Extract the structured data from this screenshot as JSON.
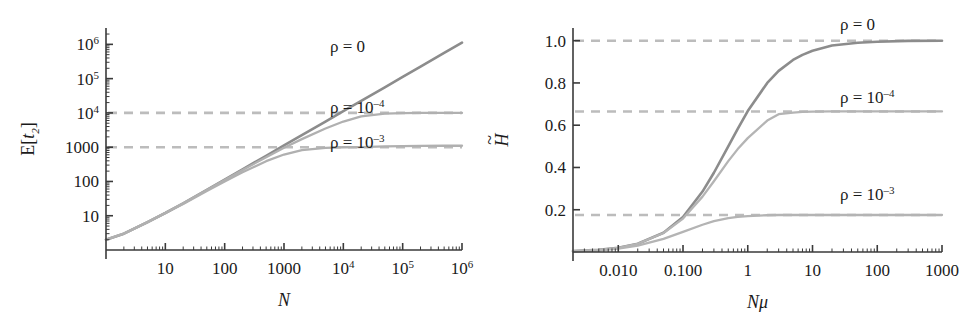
{
  "figure": {
    "background": "#ffffff",
    "panels": [
      "left",
      "right"
    ]
  },
  "colors": {
    "curve_dark": "#8c8c8c",
    "curve_mid": "#a8a8a8",
    "curve_light": "#bdbdbd",
    "dashed": "#bcbcbc",
    "axis": "#3a3a3a",
    "text": "#1a1a1a"
  },
  "chart_data": [
    {
      "id": "left",
      "type": "line",
      "title": "",
      "xlabel": "N",
      "ylabel": "E[t₂]",
      "ylabel_parts": {
        "base": "E[",
        "italic": "t",
        "sub": "2",
        "close": "]"
      },
      "xscale": "log",
      "yscale": "log",
      "xlim": [
        1,
        1000000
      ],
      "ylim": [
        1,
        3000000
      ],
      "xticks": [
        10,
        100,
        1000,
        10000,
        100000,
        1000000
      ],
      "xticklabels": [
        "10",
        "100",
        "1000",
        "10⁴",
        "10⁵",
        "10⁶"
      ],
      "xticklabel_parts": [
        {
          "base": "10",
          "sup": ""
        },
        {
          "base": "100",
          "sup": ""
        },
        {
          "base": "1000",
          "sup": ""
        },
        {
          "base": "10",
          "sup": "4"
        },
        {
          "base": "10",
          "sup": "5"
        },
        {
          "base": "10",
          "sup": "6"
        }
      ],
      "yticks": [
        10,
        100,
        1000,
        10000,
        100000,
        1000000
      ],
      "yticklabels": [
        "10",
        "100",
        "1000",
        "10⁴",
        "10⁵",
        "10⁶"
      ],
      "yticklabel_parts": [
        {
          "base": "10",
          "sup": ""
        },
        {
          "base": "100",
          "sup": ""
        },
        {
          "base": "1000",
          "sup": ""
        },
        {
          "base": "10",
          "sup": "4"
        },
        {
          "base": "10",
          "sup": "5"
        },
        {
          "base": "10",
          "sup": "6"
        }
      ],
      "grid": false,
      "minor_ticks": true,
      "legend_position": "in-plot-annotations",
      "asymptotes": [
        {
          "name": "rho-1e-4-asymptote",
          "y": 10000,
          "style": "dashed",
          "color": "#bcbcbc"
        },
        {
          "name": "rho-1e-3-asymptote",
          "y": 1000,
          "style": "dashed",
          "color": "#bcbcbc"
        }
      ],
      "annotations": [
        {
          "name": "annot-rho-0",
          "text": "ρ = 0",
          "base": "ρ = 0",
          "sup": "",
          "x_px": 330,
          "y_px": 52
        },
        {
          "name": "annot-rho-1e-4",
          "text": "ρ = 10⁻⁴",
          "base": "ρ = 10",
          "sup": "–4",
          "x_px": 330,
          "y_px": 113
        },
        {
          "name": "annot-rho-1e-3",
          "text": "ρ = 10⁻³",
          "base": "ρ = 10",
          "sup": "–3",
          "x_px": 330,
          "y_px": 148
        }
      ],
      "series": [
        {
          "name": "ρ = 0",
          "rho": 0,
          "color": "#8c8c8c",
          "plateau": null,
          "x": [
            1,
            2,
            5,
            10,
            20,
            50,
            100,
            200,
            500,
            1000,
            2000,
            5000,
            10000,
            20000,
            50000,
            100000,
            200000,
            500000,
            1000000
          ],
          "y": [
            2,
            3,
            6.5,
            12,
            23,
            57,
            113,
            226,
            560,
            1120,
            2240,
            5600,
            11200,
            22400,
            56000,
            112000,
            224000,
            560000,
            1120000
          ]
        },
        {
          "name": "ρ = 10⁻⁴",
          "rho": 0.0001,
          "color": "#b0b0b0",
          "plateau": 10000,
          "x": [
            1,
            2,
            5,
            10,
            20,
            50,
            100,
            200,
            500,
            1000,
            2000,
            5000,
            10000,
            20000,
            50000,
            100000,
            200000,
            500000,
            1000000
          ],
          "y": [
            2,
            3,
            6.5,
            12,
            23,
            56,
            110,
            215,
            510,
            960,
            1720,
            3500,
            5600,
            7900,
            9500,
            9900,
            10000,
            10000,
            10000
          ]
        },
        {
          "name": "ρ = 10⁻³",
          "rho": 0.001,
          "color": "#b0b0b0",
          "plateau": 1000,
          "x": [
            1,
            2,
            5,
            10,
            20,
            50,
            100,
            200,
            500,
            1000,
            2000,
            5000,
            10000,
            20000,
            50000,
            100000,
            200000,
            500000,
            1000000
          ],
          "y": [
            2,
            3,
            6.4,
            12,
            22,
            53,
            100,
            185,
            390,
            610,
            820,
            960,
            995,
            1000,
            1050,
            1080,
            1090,
            1100,
            1100
          ]
        }
      ]
    },
    {
      "id": "right",
      "type": "line",
      "title": "",
      "xlabel": "Nμ",
      "ylabel": "H̃",
      "ylabel_parts": {
        "italic": "H",
        "tilde": true
      },
      "xscale": "log",
      "yscale": "linear",
      "xlim": [
        0.002,
        1000
      ],
      "ylim": [
        0,
        1.06
      ],
      "xticks": [
        0.01,
        0.1,
        1,
        10,
        100,
        1000
      ],
      "xticklabels": [
        "0.010",
        "0.100",
        "1",
        "10",
        "100",
        "1000"
      ],
      "yticks": [
        0.2,
        0.4,
        0.6,
        0.8,
        1.0
      ],
      "yticklabels": [
        "0.2",
        "0.4",
        "0.6",
        "0.8",
        "1.0"
      ],
      "grid": false,
      "minor_ticks": true,
      "legend_position": "in-plot-annotations",
      "asymptotes": [
        {
          "name": "rho-0-asymptote",
          "y": 1.0,
          "style": "dashed",
          "color": "#bcbcbc"
        },
        {
          "name": "rho-1e-4-asymptote",
          "y": 0.665,
          "style": "dashed",
          "color": "#bcbcbc"
        },
        {
          "name": "rho-1e-3-asymptote",
          "y": 0.175,
          "style": "dashed",
          "color": "#bcbcbc"
        }
      ],
      "annotations": [
        {
          "name": "annot-rho-0",
          "text": "ρ = 0",
          "base": "ρ = 0",
          "sup": "",
          "x_px": 840,
          "y_px": 30
        },
        {
          "name": "annot-rho-1e-4",
          "text": "ρ = 10⁻⁴",
          "base": "ρ = 10",
          "sup": "–4",
          "x_px": 840,
          "y_px": 103
        },
        {
          "name": "annot-rho-1e-3",
          "text": "ρ = 10⁻³",
          "base": "ρ = 10",
          "sup": "–3",
          "x_px": 840,
          "y_px": 200
        }
      ],
      "series": [
        {
          "name": "ρ = 0",
          "rho": 0,
          "color": "#8c8c8c",
          "plateau": 1.0,
          "x": [
            0.002,
            0.005,
            0.01,
            0.02,
            0.05,
            0.1,
            0.2,
            0.3,
            0.5,
            0.7,
            1,
            2,
            3,
            5,
            7,
            10,
            20,
            50,
            100,
            300,
            1000
          ],
          "y": [
            0.004,
            0.01,
            0.02,
            0.039,
            0.091,
            0.166,
            0.286,
            0.375,
            0.5,
            0.583,
            0.667,
            0.8,
            0.857,
            0.909,
            0.933,
            0.952,
            0.977,
            0.99,
            0.995,
            0.999,
            1.0
          ]
        },
        {
          "name": "ρ = 10⁻⁴",
          "rho": 0.0001,
          "color": "#b4b4b4",
          "plateau": 0.665,
          "x": [
            0.002,
            0.005,
            0.01,
            0.02,
            0.05,
            0.1,
            0.2,
            0.3,
            0.5,
            0.7,
            1,
            2,
            3,
            5,
            7,
            10,
            20,
            50,
            100,
            300,
            1000
          ],
          "y": [
            0.004,
            0.01,
            0.02,
            0.039,
            0.09,
            0.158,
            0.262,
            0.335,
            0.43,
            0.487,
            0.539,
            0.622,
            0.652,
            0.66,
            0.663,
            0.664,
            0.665,
            0.665,
            0.665,
            0.665,
            0.665
          ]
        },
        {
          "name": "ρ = 10⁻³",
          "rho": 0.001,
          "color": "#b4b4b4",
          "plateau": 0.175,
          "x": [
            0.002,
            0.005,
            0.01,
            0.02,
            0.05,
            0.1,
            0.2,
            0.3,
            0.5,
            0.7,
            1,
            2,
            3,
            5,
            7,
            10,
            20,
            50,
            100,
            300,
            1000
          ],
          "y": [
            0.003,
            0.008,
            0.016,
            0.03,
            0.062,
            0.095,
            0.129,
            0.146,
            0.16,
            0.166,
            0.17,
            0.174,
            0.175,
            0.175,
            0.175,
            0.175,
            0.175,
            0.175,
            0.175,
            0.175,
            0.175
          ]
        }
      ]
    }
  ]
}
